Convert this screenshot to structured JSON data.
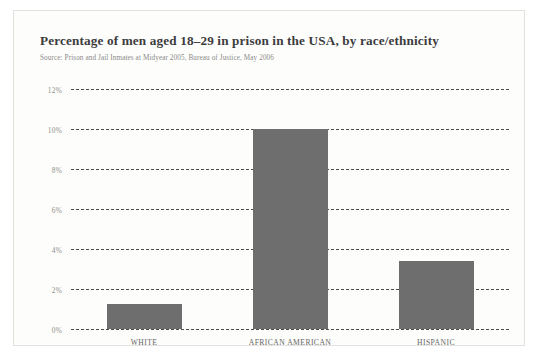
{
  "chart_data": {
    "type": "bar",
    "title": "Percentage of men aged 18–29 in prison in the USA, by race/ethnicity",
    "subtitle": "Source: Prison and Jail Inmates at Midyear 2005, Bureau of Justice, May 2006",
    "categories": [
      "WHITE",
      "AFRICAN AMERICAN",
      "HISPANIC"
    ],
    "values": [
      1.25,
      10.0,
      3.4
    ],
    "xlabel": "",
    "ylabel": "",
    "ylim": [
      0,
      12
    ],
    "ytick_values": [
      0,
      2,
      4,
      6,
      8,
      10,
      12
    ],
    "ytick_labels": [
      "0%",
      "2%",
      "4%",
      "6%",
      "8%",
      "10%",
      "12%"
    ],
    "grid": "horizontal-dashed",
    "legend": "none",
    "bar_color": "#6e6e6e",
    "gridline_color": "#4a4a4a",
    "background_color": "#fdfdfc",
    "border_color": "#e2e2de",
    "title_color": "#3c3c3c",
    "source_color": "#8b8b88",
    "tick_color": "#8e8e8b"
  }
}
